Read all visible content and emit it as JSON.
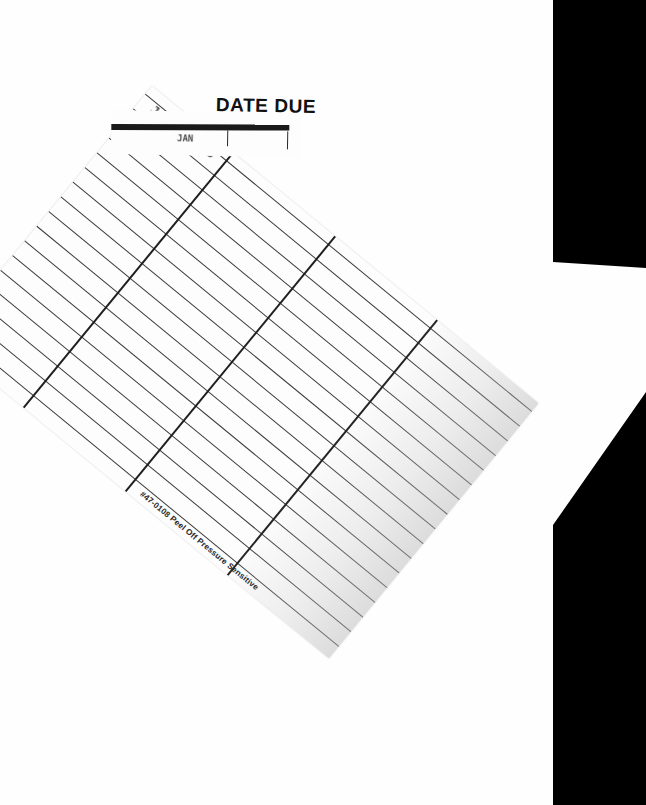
{
  "document": {
    "type": "library-date-due-card",
    "background_color": "#fefefe",
    "shadow_color": "#000000"
  },
  "slip": {
    "title": "DATE DUE",
    "smudge_text": "JAN",
    "bar_color": "#1a1a1a",
    "rotation_deg": 1.1
  },
  "card": {
    "rotation_deg": 39.4,
    "rule_color": "#3a3a3a",
    "column_color": "#1f1f1f",
    "row_count": 17,
    "column_count": 3,
    "stamp": "JAN 10 19",
    "footer_text": "#47-0108  Peel Off Pressure Sensitive",
    "row_offsets_px": [
      10,
      29,
      48,
      67,
      86,
      105,
      124,
      143,
      162,
      181,
      200,
      219,
      238,
      257,
      276,
      295,
      314
    ],
    "column_offsets_px": [
      104,
      236,
      368
    ]
  }
}
